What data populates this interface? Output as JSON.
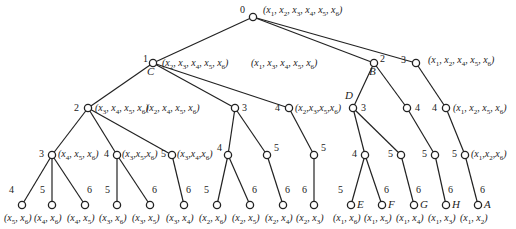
{
  "diagram": {
    "type": "search-tree",
    "edge_color": "#222222",
    "node_stroke": "#222222",
    "nodes": [
      {
        "id": "n0",
        "x": 253,
        "y": 17,
        "num": "0",
        "tuple": "(x1, x2, x3, x4, x5, x6)",
        "letter": ""
      },
      {
        "id": "n1",
        "x": 153,
        "y": 63,
        "num": "1",
        "tuple": "(x2, x3, x4, x5, x6)",
        "letter": "C"
      },
      {
        "id": "n2",
        "x": 374,
        "y": 63,
        "num": "2",
        "tuple": "(x1, x3, x4, x5, x6)",
        "letter": "B"
      },
      {
        "id": "n3",
        "x": 416,
        "y": 63,
        "num": "3",
        "tuple": "(x1, x2, x4, x5, x6)",
        "letter": ""
      },
      {
        "id": "n12",
        "x": 88,
        "y": 108,
        "num": "2",
        "tuple": "(x3, x4, x5, x6)",
        "letter": ""
      },
      {
        "id": "n13",
        "x": 235,
        "y": 108,
        "num": "3",
        "tuple": "(x2, x4, x5, x6)",
        "letter": ""
      },
      {
        "id": "n14",
        "x": 289,
        "y": 108,
        "num": "4",
        "tuple": "(x2,x3,x5,x6)",
        "letter": ""
      },
      {
        "id": "n23",
        "x": 353,
        "y": 108,
        "num": "3",
        "tuple": "",
        "letter": "D"
      },
      {
        "id": "n24",
        "x": 407,
        "y": 108,
        "num": "4",
        "tuple": "",
        "letter": ""
      },
      {
        "id": "n34",
        "x": 446,
        "y": 108,
        "num": "4",
        "tuple": "(x1, x2, x5, x6)",
        "letter": ""
      },
      {
        "id": "n123",
        "x": 52,
        "y": 155,
        "num": "3",
        "tuple": "(x4, x5, x6)",
        "letter": ""
      },
      {
        "id": "n124",
        "x": 117,
        "y": 155,
        "num": "4",
        "tuple": "(x3,x5,x6)",
        "letter": ""
      },
      {
        "id": "n125",
        "x": 172,
        "y": 155,
        "num": "5",
        "tuple": "(x3,x4,x6)",
        "letter": ""
      },
      {
        "id": "n134",
        "x": 228,
        "y": 155,
        "num": "4",
        "tuple": "",
        "letter": ""
      },
      {
        "id": "n135",
        "x": 267,
        "y": 155,
        "num": "5",
        "tuple": "",
        "letter": ""
      },
      {
        "id": "n145",
        "x": 314,
        "y": 155,
        "num": "5",
        "tuple": "",
        "letter": ""
      },
      {
        "id": "n234",
        "x": 365,
        "y": 155,
        "num": "4",
        "tuple": "",
        "letter": ""
      },
      {
        "id": "n235",
        "x": 401,
        "y": 155,
        "num": "5",
        "tuple": "",
        "letter": ""
      },
      {
        "id": "n245",
        "x": 435,
        "y": 155,
        "num": "5",
        "tuple": "",
        "letter": ""
      },
      {
        "id": "n345",
        "x": 465,
        "y": 155,
        "num": "5",
        "tuple": "(x1,x2,x6)",
        "letter": ""
      },
      {
        "id": "l1",
        "x": 22,
        "y": 205,
        "num": "4",
        "tuple": "(x5, x6)",
        "letter": ""
      },
      {
        "id": "l2",
        "x": 52,
        "y": 205,
        "num": "5",
        "tuple": "(x4, x6)",
        "letter": ""
      },
      {
        "id": "l3",
        "x": 85,
        "y": 205,
        "num": "6",
        "tuple": "(x4, x5)",
        "letter": ""
      },
      {
        "id": "l4",
        "x": 117,
        "y": 205,
        "num": "5",
        "tuple": "(x3, x6)",
        "letter": ""
      },
      {
        "id": "l5",
        "x": 150,
        "y": 205,
        "num": "6",
        "tuple": "(x3, x5)",
        "letter": ""
      },
      {
        "id": "l6",
        "x": 184,
        "y": 205,
        "num": "6",
        "tuple": "(x3, x4)",
        "letter": ""
      },
      {
        "id": "l7",
        "x": 217,
        "y": 205,
        "num": "5",
        "tuple": "(x2, x6)",
        "letter": ""
      },
      {
        "id": "l8",
        "x": 250,
        "y": 205,
        "num": "6",
        "tuple": "(x2, x5)",
        "letter": ""
      },
      {
        "id": "l9",
        "x": 283,
        "y": 205,
        "num": "6",
        "tuple": "(x2, x4)",
        "letter": ""
      },
      {
        "id": "l10",
        "x": 314,
        "y": 205,
        "num": "6",
        "tuple": "(x2, x3)",
        "letter": ""
      },
      {
        "id": "l11",
        "x": 351,
        "y": 205,
        "num": "5",
        "tuple": "(x1, x6)",
        "letter": "E"
      },
      {
        "id": "l12",
        "x": 382,
        "y": 205,
        "num": "6",
        "tuple": "(x1, x5)",
        "letter": "F"
      },
      {
        "id": "l13",
        "x": 414,
        "y": 205,
        "num": "6",
        "tuple": "(x1, x4)",
        "letter": "G"
      },
      {
        "id": "l14",
        "x": 446,
        "y": 205,
        "num": "6",
        "tuple": "(x1, x3)",
        "letter": "H"
      },
      {
        "id": "l15",
        "x": 478,
        "y": 205,
        "num": "6",
        "tuple": "(x1, x2)",
        "letter": "A"
      }
    ],
    "edges": [
      [
        "n0",
        "n1"
      ],
      [
        "n0",
        "n2"
      ],
      [
        "n0",
        "n3"
      ],
      [
        "n1",
        "n12"
      ],
      [
        "n1",
        "n13"
      ],
      [
        "n1",
        "n14"
      ],
      [
        "n2",
        "n23"
      ],
      [
        "n2",
        "n24"
      ],
      [
        "n3",
        "n34"
      ],
      [
        "n12",
        "n123"
      ],
      [
        "n12",
        "n124"
      ],
      [
        "n12",
        "n125"
      ],
      [
        "n13",
        "n134"
      ],
      [
        "n13",
        "n135"
      ],
      [
        "n14",
        "n145"
      ],
      [
        "n23",
        "n234"
      ],
      [
        "n23",
        "n235"
      ],
      [
        "n24",
        "n245"
      ],
      [
        "n34",
        "n345"
      ],
      [
        "n123",
        "l1"
      ],
      [
        "n123",
        "l2"
      ],
      [
        "n123",
        "l3"
      ],
      [
        "n124",
        "l4"
      ],
      [
        "n124",
        "l5"
      ],
      [
        "n125",
        "l6"
      ],
      [
        "n134",
        "l7"
      ],
      [
        "n134",
        "l8"
      ],
      [
        "n135",
        "l9"
      ],
      [
        "n145",
        "l10"
      ],
      [
        "n234",
        "l11"
      ],
      [
        "n234",
        "l12"
      ],
      [
        "n235",
        "l13"
      ],
      [
        "n245",
        "l14"
      ],
      [
        "n345",
        "l15"
      ]
    ],
    "label_positions": {
      "n0": {
        "num": [
          -13,
          -12
        ],
        "tuple": [
          10,
          -12
        ]
      },
      "n1": {
        "num": [
          -10,
          -9
        ],
        "tuple": [
          9,
          -5
        ],
        "letter": [
          -6,
          3
        ]
      },
      "n2": {
        "num": [
          6,
          -9
        ],
        "tuple": [
          -123,
          -5
        ],
        "letter": [
          -5,
          3
        ]
      },
      "n3": {
        "num": [
          -15,
          -8
        ],
        "tuple": [
          12,
          -8
        ]
      },
      "n12": {
        "num": [
          -14,
          -5
        ],
        "tuple": [
          7,
          -5
        ]
      },
      "n13": {
        "num": [
          7,
          -5
        ],
        "tuple": [
          -89,
          -5
        ]
      },
      "n14": {
        "num": [
          -14,
          -5
        ],
        "tuple": [
          6,
          -5
        ]
      },
      "n23": {
        "num": [
          8,
          -5
        ],
        "letter": [
          -8,
          -18
        ]
      },
      "n24": {
        "num": [
          8,
          -5
        ]
      },
      "n34": {
        "num": [
          -14,
          -5
        ],
        "tuple": [
          7,
          -5
        ]
      },
      "n123": {
        "num": [
          -13,
          -6
        ],
        "tuple": [
          6,
          -6
        ]
      },
      "n124": {
        "num": [
          -13,
          -6
        ],
        "tuple": [
          5,
          -6
        ]
      },
      "n125": {
        "num": [
          -11,
          -6
        ],
        "tuple": [
          5,
          -6
        ]
      },
      "n134": {
        "num": [
          -11,
          -12
        ]
      },
      "n135": {
        "num": [
          7,
          -12
        ]
      },
      "n145": {
        "num": [
          7,
          -12
        ]
      },
      "n234": {
        "num": [
          -13,
          -6
        ]
      },
      "n235": {
        "num": [
          -13,
          -6
        ]
      },
      "n245": {
        "num": [
          -13,
          -6
        ]
      },
      "n345": {
        "num": [
          -13,
          -6
        ],
        "tuple": [
          6,
          -6
        ]
      }
    }
  }
}
